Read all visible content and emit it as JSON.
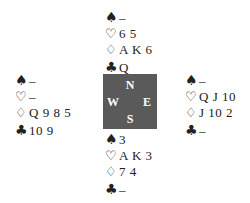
{
  "symbols": {
    "spades": "♠",
    "hearts": "♡",
    "diamonds": "♢",
    "clubs": "♣"
  },
  "compass": {
    "north": "N",
    "south": "S",
    "west": "W",
    "east": "E",
    "background_color": "#5a5a5a"
  },
  "hands": {
    "north": {
      "spades": "–",
      "hearts": "6 5",
      "diamonds": "A K 6",
      "clubs": "Q"
    },
    "west": {
      "spades": "–",
      "hearts": "–",
      "diamonds": "Q 9 8 5",
      "clubs": "10 9"
    },
    "east": {
      "spades": "–",
      "hearts": "Q J 10",
      "diamonds": "J 10 2",
      "clubs": "–"
    },
    "south": {
      "spades": "3",
      "hearts": "A K 3",
      "diamonds": "7 4",
      "clubs": "–"
    }
  }
}
